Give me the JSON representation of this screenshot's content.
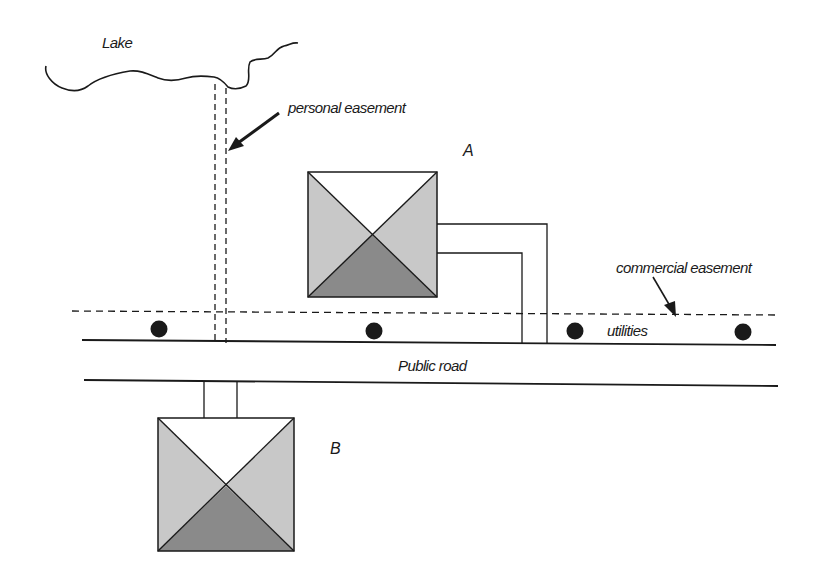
{
  "diagram": {
    "type": "property easement site plan",
    "labels": {
      "lake": "Lake",
      "personal_easement": "personal easement",
      "house_a": "A",
      "commercial_easement": "commercial easement",
      "utilities": "utilities",
      "public_road": "Public road",
      "house_b": "B"
    },
    "colors": {
      "line": "#1a1a1a",
      "roof_light": "#c8c8c8",
      "roof_dark": "#8a8a8a",
      "roof_white": "#ffffff",
      "background": "#ffffff"
    },
    "elements": [
      {
        "id": "lake",
        "kind": "shoreline"
      },
      {
        "id": "personal-easement",
        "kind": "dashed corridor",
        "from": "lake",
        "to": "utilities-line"
      },
      {
        "id": "house-a",
        "kind": "building",
        "connects": "public road via driveway"
      },
      {
        "id": "commercial-easement",
        "kind": "dashed line",
        "along": "road"
      },
      {
        "id": "utility-poles",
        "kind": "dots",
        "count": 4
      },
      {
        "id": "public-road",
        "kind": "road"
      },
      {
        "id": "house-b",
        "kind": "building",
        "connects": "public road via driveway"
      }
    ]
  }
}
